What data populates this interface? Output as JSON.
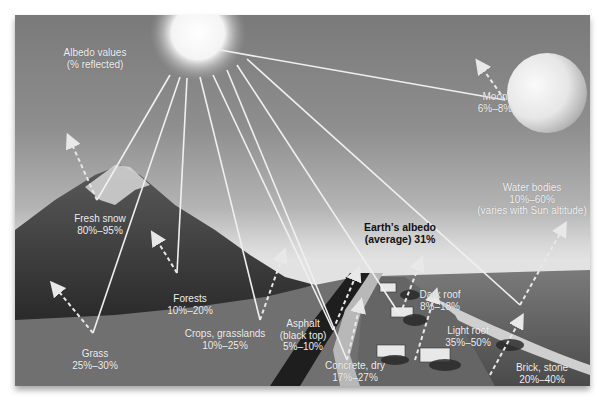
{
  "title": {
    "line1": "Albedo values",
    "line2": "(% reflected)"
  },
  "earth_average": {
    "line1": "Earth’s albedo",
    "line2": "(average) 31%"
  },
  "surfaces": [
    {
      "name": "Moon",
      "range": "6%–8%"
    },
    {
      "name": "Water bodies",
      "range": "10%–60%",
      "note": "(varies with Sun altitude)"
    },
    {
      "name": "Fresh snow",
      "range": "80%–95%"
    },
    {
      "name": "Forests",
      "range": "10%–20%"
    },
    {
      "name": "Crops, grasslands",
      "range": "10%–25%"
    },
    {
      "name": "Grass",
      "range": "25%–30%"
    },
    {
      "name": "Asphalt",
      "sub": "(black top)",
      "range": "5%–10%"
    },
    {
      "name": "Concrete, dry",
      "range": "17%–27%"
    },
    {
      "name": "Dark roof",
      "range": "8%–18%"
    },
    {
      "name": "Light roof",
      "range": "35%–50%"
    },
    {
      "name": "Brick, stone",
      "range": "20%–40%"
    }
  ],
  "colors": {
    "sky_top": "#7a7a7a",
    "horizon": "#e2e2e2",
    "mountain": "#3a3a3a",
    "ground": "#6e6e6e",
    "ocean": "#5c5c5c",
    "road": "#1e1e1e",
    "ray": "#f0f0f0"
  }
}
